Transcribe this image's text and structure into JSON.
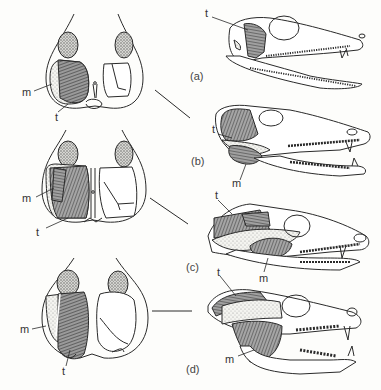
{
  "figure": {
    "panels": [
      {
        "id": "a",
        "label": "(a)",
        "muscles": {
          "temporalis": "t",
          "masseter": "m"
        }
      },
      {
        "id": "b",
        "label": "(b)",
        "muscles": {
          "temporalis": "t",
          "masseter": "m"
        }
      },
      {
        "id": "c",
        "label": "(c)",
        "muscles": {
          "temporalis": "t",
          "masseter": "m"
        }
      },
      {
        "id": "d",
        "label": "(d)",
        "muscles": {
          "temporalis": "t",
          "masseter": "m"
        }
      }
    ],
    "colors": {
      "line": "#2a2a2a",
      "muscle_fill": "#6a6a6a",
      "stipple": "#bdbdbd",
      "background": "#fdfdfb"
    }
  }
}
